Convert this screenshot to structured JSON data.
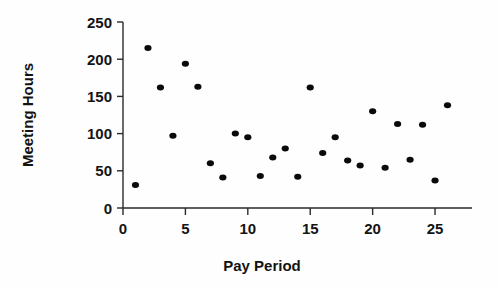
{
  "chart_data": {
    "type": "scatter",
    "title": "",
    "xlabel": "Pay Period",
    "ylabel": "Meeting Hours",
    "xlim": [
      0,
      27
    ],
    "ylim": [
      0,
      250
    ],
    "xticks": [
      0,
      5,
      10,
      15,
      20,
      25
    ],
    "yticks": [
      0,
      50,
      100,
      150,
      200,
      250
    ],
    "xtick_labels": [
      "0",
      "5",
      "10",
      "15",
      "20",
      "25"
    ],
    "ytick_labels": [
      "0",
      "50",
      "100",
      "150",
      "200",
      "250"
    ],
    "grid": false,
    "legend": "none",
    "marker": "filled-circle",
    "marker_color": "#0a0a0a",
    "x": [
      1,
      2,
      3,
      4,
      5,
      6,
      7,
      8,
      9,
      10,
      11,
      12,
      13,
      14,
      15,
      16,
      17,
      18,
      19,
      20,
      21,
      22,
      23,
      24,
      25,
      26
    ],
    "y": [
      31,
      215,
      162,
      97,
      194,
      163,
      60,
      41,
      100,
      95,
      43,
      68,
      80,
      42,
      162,
      74,
      95,
      64,
      57,
      130,
      54,
      113,
      65,
      112,
      37,
      138
    ],
    "series": [
      {
        "name": "Meeting Hours",
        "points": [
          {
            "x": 1,
            "y": 31
          },
          {
            "x": 2,
            "y": 215
          },
          {
            "x": 3,
            "y": 162
          },
          {
            "x": 4,
            "y": 97
          },
          {
            "x": 5,
            "y": 194
          },
          {
            "x": 6,
            "y": 163
          },
          {
            "x": 7,
            "y": 60
          },
          {
            "x": 8,
            "y": 41
          },
          {
            "x": 9,
            "y": 100
          },
          {
            "x": 10,
            "y": 95
          },
          {
            "x": 11,
            "y": 43
          },
          {
            "x": 12,
            "y": 68
          },
          {
            "x": 13,
            "y": 80
          },
          {
            "x": 14,
            "y": 42
          },
          {
            "x": 15,
            "y": 162
          },
          {
            "x": 16,
            "y": 74
          },
          {
            "x": 17,
            "y": 95
          },
          {
            "x": 18,
            "y": 64
          },
          {
            "x": 19,
            "y": 57
          },
          {
            "x": 20,
            "y": 130
          },
          {
            "x": 21,
            "y": 54
          },
          {
            "x": 22,
            "y": 113
          },
          {
            "x": 23,
            "y": 65
          },
          {
            "x": 24,
            "y": 112
          },
          {
            "x": 25,
            "y": 37
          },
          {
            "x": 26,
            "y": 138
          }
        ]
      }
    ]
  }
}
